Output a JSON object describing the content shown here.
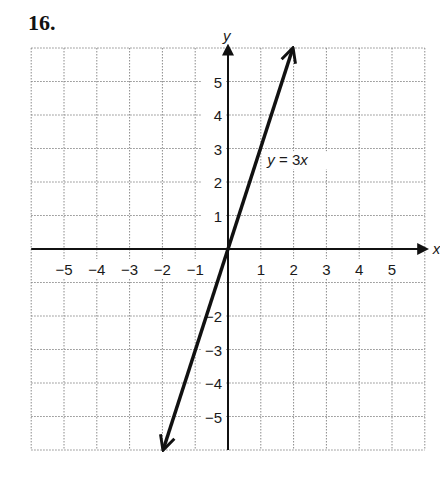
{
  "problem_number": "16.",
  "chart_data": {
    "type": "line",
    "title": "",
    "xlabel": "x",
    "ylabel": "y",
    "xlim": [
      -6,
      6
    ],
    "ylim": [
      -6,
      6
    ],
    "grid": true,
    "x_ticks": [
      "−5",
      "−4",
      "−3",
      "−2",
      "−1",
      "1",
      "2",
      "3",
      "4",
      "5"
    ],
    "y_ticks": [
      "5",
      "4",
      "3",
      "2",
      "1",
      "−2",
      "−3",
      "−4",
      "−5"
    ],
    "series": [
      {
        "name": "y = 3x",
        "equation": "y = 3x",
        "slope": 3,
        "intercept": 0,
        "x": [
          -2,
          2
        ],
        "y": [
          -6,
          6
        ],
        "arrows": "both"
      }
    ],
    "annotations": [
      {
        "text": "y = 3x",
        "x": 1.2,
        "y": 2.5
      }
    ]
  },
  "labels": {
    "x_axis": "x",
    "y_axis": "y",
    "equation": "y = 3x"
  }
}
